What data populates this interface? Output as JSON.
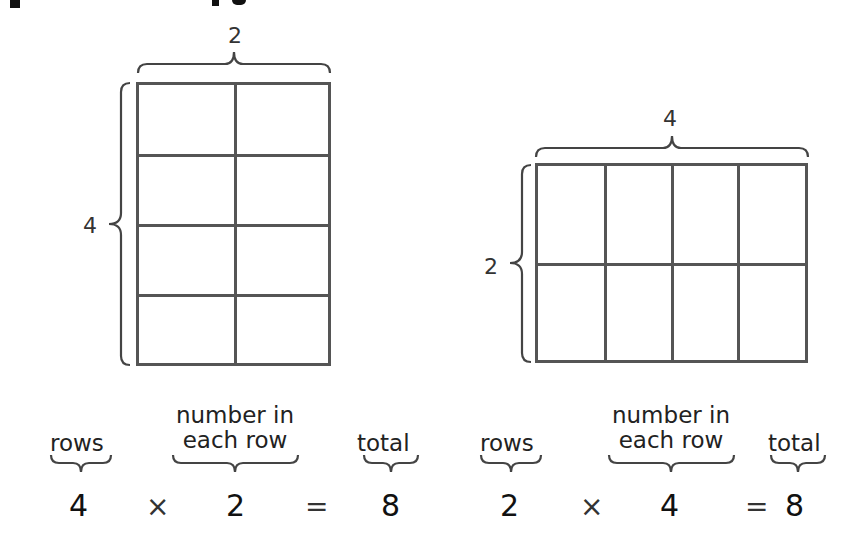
{
  "top_title_fragment": "cropped heading (only descenders visible)",
  "arrays": [
    {
      "id": "left",
      "rows": 4,
      "columns": 2,
      "rows_label": "4",
      "columns_label": "2"
    },
    {
      "id": "right",
      "rows": 2,
      "columns": 4,
      "rows_label": "2",
      "columns_label": "4"
    }
  ],
  "equations": [
    {
      "rows_caption": "rows",
      "number_caption_line1": "number in",
      "number_caption_line2": "each row",
      "total_caption": "total",
      "factor1": "4",
      "times": "×",
      "factor2": "2",
      "equals": "=",
      "product": "8"
    },
    {
      "rows_caption": "rows",
      "number_caption_line1": "number in",
      "number_caption_line2": "each row",
      "total_caption": "total",
      "factor1": "2",
      "times": "×",
      "factor2": "4",
      "equals": "=",
      "product": "8"
    }
  ],
  "colors": {
    "grid_line": "#555555",
    "text": "#1a1a1a",
    "background": "#ffffff"
  }
}
